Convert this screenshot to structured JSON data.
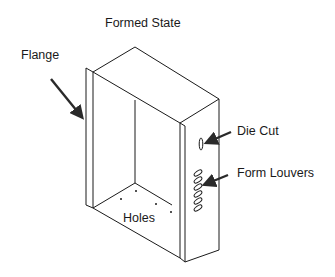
{
  "diagram": {
    "title": "Formed State",
    "labels": {
      "flange": "Flange",
      "die_cut": "Die Cut",
      "form_louvers": "Form Louvers",
      "holes": "Holes"
    },
    "features": {
      "louver_count": 6,
      "hole_count": 4
    },
    "colors": {
      "line": "#1a1a1a",
      "arrow": "#2a2a2a",
      "background": "#ffffff"
    }
  }
}
